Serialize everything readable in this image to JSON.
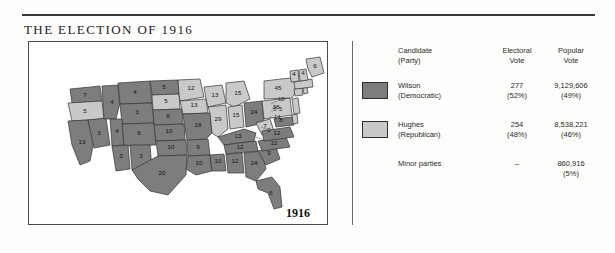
{
  "title": "THE ELECTION OF 1916",
  "map": {
    "year_label": "1916",
    "colors": {
      "wilson": "#7d7d7d",
      "hughes": "#c9c9c9",
      "border": "#333333",
      "background": "#ffffff"
    }
  },
  "legend": {
    "headers": {
      "candidate": "Candidate",
      "candidate_sub": "(Party)",
      "electoral": "Electoral",
      "electoral_sub": "Vote",
      "popular": "Popular",
      "popular_sub": "Vote"
    },
    "rows": [
      {
        "name": "Wilson",
        "party": "(Democratic)",
        "electoral": "277",
        "electoral_pct": "(52%)",
        "popular": "9,129,606",
        "popular_pct": "(49%)",
        "swatch": "#7d7d7d"
      },
      {
        "name": "Hughes",
        "party": "(Republican)",
        "electoral": "254",
        "electoral_pct": "(48%)",
        "popular": "8,538,221",
        "popular_pct": "(46%)",
        "swatch": "#c9c9c9"
      },
      {
        "name": "Minor parties",
        "party": "",
        "electoral": "–",
        "electoral_pct": "",
        "popular": "860,916",
        "popular_pct": "(5%)",
        "swatch": ""
      }
    ]
  },
  "chart_data": {
    "type": "map",
    "title": "THE ELECTION OF 1916",
    "legend_position": "right",
    "categories": [
      "Wilson (Democratic)",
      "Hughes (Republican)",
      "Minor parties"
    ],
    "series": [
      {
        "name": "Electoral Vote",
        "values": [
          277,
          254,
          0
        ]
      },
      {
        "name": "Popular Vote",
        "values": [
          9129606,
          8538221,
          860916
        ]
      },
      {
        "name": "Electoral Vote %",
        "values": [
          52,
          48,
          0
        ]
      },
      {
        "name": "Popular Vote %",
        "values": [
          49,
          46,
          5
        ]
      }
    ],
    "states": [
      {
        "code": "WA",
        "votes": 7,
        "winner": "Wilson"
      },
      {
        "code": "OR",
        "votes": 5,
        "winner": "Hughes"
      },
      {
        "code": "CA",
        "votes": 13,
        "winner": "Wilson"
      },
      {
        "code": "NV",
        "votes": 3,
        "winner": "Wilson"
      },
      {
        "code": "ID",
        "votes": 4,
        "winner": "Wilson"
      },
      {
        "code": "MT",
        "votes": 4,
        "winner": "Wilson"
      },
      {
        "code": "WY",
        "votes": 3,
        "winner": "Wilson"
      },
      {
        "code": "UT",
        "votes": 4,
        "winner": "Wilson"
      },
      {
        "code": "CO",
        "votes": 6,
        "winner": "Wilson"
      },
      {
        "code": "AZ",
        "votes": 3,
        "winner": "Wilson"
      },
      {
        "code": "NM",
        "votes": 3,
        "winner": "Wilson"
      },
      {
        "code": "ND",
        "votes": 5,
        "winner": "Wilson"
      },
      {
        "code": "SD",
        "votes": 5,
        "winner": "Hughes"
      },
      {
        "code": "NE",
        "votes": 8,
        "winner": "Wilson"
      },
      {
        "code": "KS",
        "votes": 10,
        "winner": "Wilson"
      },
      {
        "code": "OK",
        "votes": 10,
        "winner": "Wilson"
      },
      {
        "code": "TX",
        "votes": 20,
        "winner": "Wilson"
      },
      {
        "code": "MN",
        "votes": 12,
        "winner": "Hughes"
      },
      {
        "code": "IA",
        "votes": 13,
        "winner": "Hughes"
      },
      {
        "code": "MO",
        "votes": 18,
        "winner": "Wilson"
      },
      {
        "code": "AR",
        "votes": 9,
        "winner": "Wilson"
      },
      {
        "code": "LA",
        "votes": 10,
        "winner": "Wilson"
      },
      {
        "code": "WI",
        "votes": 13,
        "winner": "Hughes"
      },
      {
        "code": "IL",
        "votes": 29,
        "winner": "Hughes"
      },
      {
        "code": "MS",
        "votes": 10,
        "winner": "Wilson"
      },
      {
        "code": "MI",
        "votes": 15,
        "winner": "Hughes"
      },
      {
        "code": "IN",
        "votes": 15,
        "winner": "Hughes"
      },
      {
        "code": "KY",
        "votes": 13,
        "winner": "Wilson"
      },
      {
        "code": "TN",
        "votes": 12,
        "winner": "Wilson"
      },
      {
        "code": "AL",
        "votes": 12,
        "winner": "Wilson"
      },
      {
        "code": "GA",
        "votes": 14,
        "winner": "Wilson"
      },
      {
        "code": "FL",
        "votes": 6,
        "winner": "Wilson"
      },
      {
        "code": "OH",
        "votes": 24,
        "winner": "Wilson"
      },
      {
        "code": "WV",
        "votes": 7,
        "winner": "Hughes"
      },
      {
        "code": "SC",
        "votes": 9,
        "winner": "Wilson"
      },
      {
        "code": "NC",
        "votes": 12,
        "winner": "Wilson"
      },
      {
        "code": "VA",
        "votes": 12,
        "winner": "Wilson"
      },
      {
        "code": "PA",
        "votes": 38,
        "winner": "Hughes"
      },
      {
        "code": "NY",
        "votes": 45,
        "winner": "Hughes"
      },
      {
        "code": "MD",
        "votes": 8,
        "winner": "Wilson"
      },
      {
        "code": "DE",
        "votes": 3,
        "winner": "Hughes"
      },
      {
        "code": "NJ",
        "votes": 14,
        "winner": "Hughes"
      },
      {
        "code": "CT",
        "votes": 7,
        "winner": "Hughes"
      },
      {
        "code": "RI",
        "votes": 5,
        "winner": "Hughes"
      },
      {
        "code": "MA",
        "votes": 18,
        "winner": "Hughes"
      },
      {
        "code": "VT",
        "votes": 4,
        "winner": "Hughes"
      },
      {
        "code": "NH",
        "votes": 4,
        "winner": "Hughes"
      },
      {
        "code": "ME",
        "votes": 6,
        "winner": "Hughes"
      }
    ]
  }
}
